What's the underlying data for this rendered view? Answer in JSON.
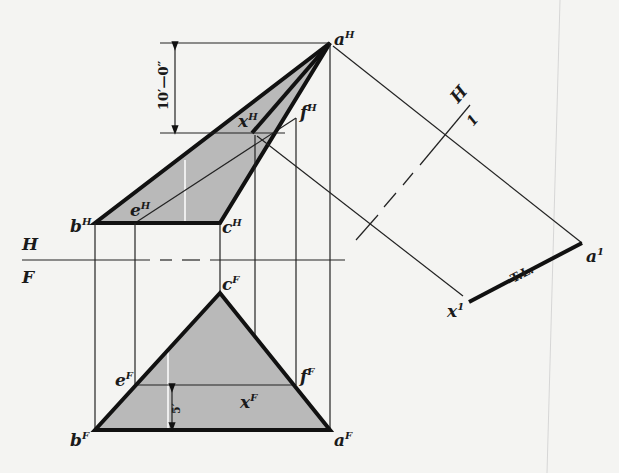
{
  "figure": {
    "type": "descriptive-geometry",
    "views": {
      "top": {
        "name": "H",
        "points": {
          "a": {
            "label": "a",
            "sup": "H"
          },
          "b": {
            "label": "b",
            "sup": "H"
          },
          "c": {
            "label": "c",
            "sup": "H"
          },
          "e": {
            "label": "e",
            "sup": "H"
          },
          "f": {
            "label": "f",
            "sup": "H"
          },
          "x": {
            "label": "x",
            "sup": "H"
          }
        }
      },
      "front": {
        "name": "F",
        "points": {
          "a": {
            "label": "a",
            "sup": "F"
          },
          "b": {
            "label": "b",
            "sup": "F"
          },
          "c": {
            "label": "c",
            "sup": "F"
          },
          "e": {
            "label": "e",
            "sup": "F"
          },
          "f": {
            "label": "f",
            "sup": "F"
          },
          "x": {
            "label": "x",
            "sup": "F"
          }
        }
      },
      "auxiliary": {
        "name": "1",
        "points": {
          "a": {
            "label": "a",
            "sup": "1"
          },
          "x": {
            "label": "x",
            "sup": "1"
          }
        },
        "true_length_label": "T.L."
      }
    },
    "folding_lines": {
      "hf": {
        "upper": "H",
        "lower": "F"
      },
      "h1": {
        "upper": "H",
        "lower": "1"
      }
    },
    "dimensions": {
      "vertical_top": "10′—0″",
      "front_offset": "5′"
    },
    "colors": {
      "line": "#111111",
      "shade": "#b9b9b9",
      "paper": "#f4f4f2"
    }
  }
}
